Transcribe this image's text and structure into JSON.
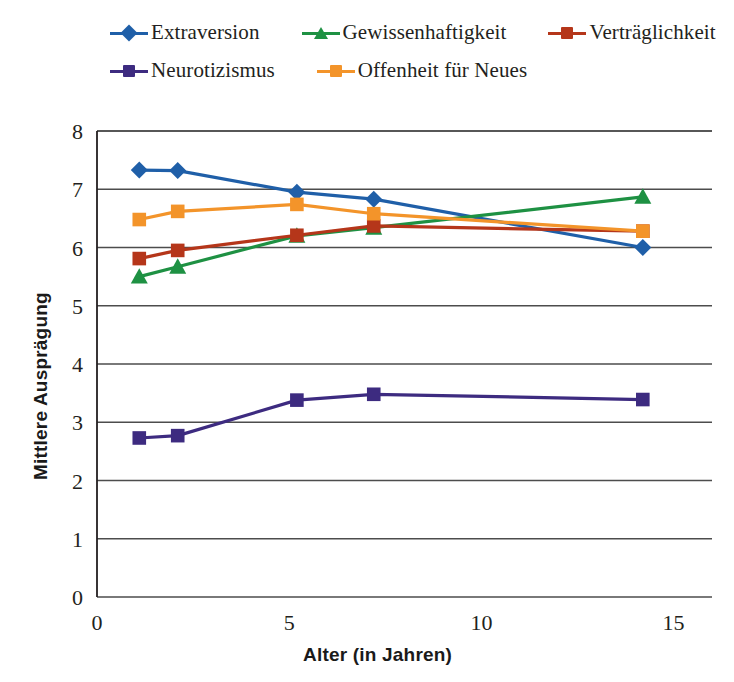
{
  "chart_data": {
    "type": "line",
    "title": "",
    "xlabel": "Alter (in Jahren)",
    "ylabel": "Mittlere Ausprägung",
    "xlim": [
      0,
      16
    ],
    "ylim": [
      0,
      8
    ],
    "xticks": [
      0,
      5,
      10,
      15
    ],
    "yticks": [
      0,
      1,
      2,
      3,
      4,
      5,
      6,
      7,
      8
    ],
    "grid": "horizontal",
    "legend_position": "top",
    "series": [
      {
        "name": "Extraversion",
        "color": "#1f5fa8",
        "marker": "diamond",
        "x": [
          1.1,
          2.1,
          5.2,
          7.2,
          14.2
        ],
        "values": [
          7.33,
          7.32,
          6.95,
          6.83,
          6.0
        ]
      },
      {
        "name": "Gewissenhaftigkeit",
        "color": "#1e9143",
        "marker": "triangle",
        "x": [
          1.1,
          2.1,
          5.2,
          7.2,
          14.2
        ],
        "values": [
          5.5,
          5.67,
          6.2,
          6.34,
          6.87
        ]
      },
      {
        "name": "Verträglichkeit",
        "color": "#b5361a",
        "marker": "square",
        "x": [
          1.1,
          2.1,
          5.2,
          7.2,
          14.2
        ],
        "values": [
          5.81,
          5.95,
          6.21,
          6.37,
          6.28
        ]
      },
      {
        "name": "Neurotizismus",
        "color": "#3d2b80",
        "marker": "square",
        "x": [
          1.1,
          2.1,
          5.2,
          7.2,
          14.2
        ],
        "values": [
          2.73,
          2.77,
          3.38,
          3.48,
          3.39
        ]
      },
      {
        "name": "Offenheit für Neues",
        "color": "#f3942a",
        "marker": "square",
        "x": [
          1.1,
          2.1,
          5.2,
          7.2,
          14.2
        ],
        "values": [
          6.48,
          6.62,
          6.74,
          6.58,
          6.28
        ]
      }
    ]
  },
  "legend": {
    "rows": [
      [
        {
          "label": "Extraversion",
          "color": "#1f5fa8",
          "marker": "diamond"
        },
        {
          "label": "Gewissenhaftigkeit",
          "color": "#1e9143",
          "marker": "triangle"
        },
        {
          "label": "Verträglichkeit",
          "color": "#b5361a",
          "marker": "square"
        }
      ],
      [
        {
          "label": "Neurotizismus",
          "color": "#3d2b80",
          "marker": "square"
        },
        {
          "label": "Offenheit für Neues",
          "color": "#f3942a",
          "marker": "square"
        }
      ]
    ]
  },
  "axes": {
    "y_title": "Mittlere Ausprägung",
    "x_title": "Alter (in Jahren)",
    "y_tick_labels": [
      "8",
      "7",
      "6",
      "5",
      "4",
      "3",
      "2",
      "1",
      "0"
    ],
    "x_tick_labels": [
      "0",
      "5",
      "10",
      "15"
    ]
  },
  "colors": {
    "axis": "#231f20",
    "grid": "#4d4d4d",
    "background": "#ffffff"
  }
}
